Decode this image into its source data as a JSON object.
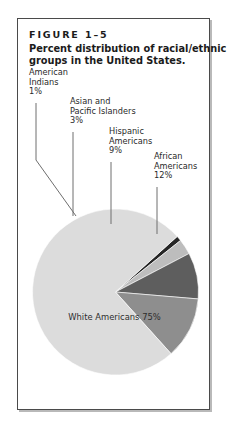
{
  "figure": {
    "number": "FIGURE 1–5",
    "caption_line1": "Percent distribution of racial/ethnic",
    "caption_line2": "groups in the United States."
  },
  "callouts": [
    {
      "key": "american-indians",
      "line1": "American",
      "line2": "Indians",
      "line3": "1%"
    },
    {
      "key": "asian-pacific",
      "line1": "Asian and",
      "line2": "Pacific Islanders",
      "line3": "3%"
    },
    {
      "key": "hispanic",
      "line1": "Hispanic",
      "line2": "Americans",
      "line3": "9%"
    },
    {
      "key": "african",
      "line1": "African",
      "line2": "Americans",
      "line3": "12%"
    }
  ],
  "inner_label": {
    "white_americans": "White Americans 75%"
  },
  "chart_data": {
    "type": "pie",
    "title": "Percent distribution of racial/ethnic groups in the United States.",
    "units": "percent",
    "total": 100,
    "legend": "none (direct labels with leader lines)",
    "grid": false,
    "start_angle_deg": -42,
    "direction": "clockwise",
    "categories": [
      "American Indians",
      "Asian and Pacific Islanders",
      "Hispanic Americans",
      "African Americans",
      "White Americans"
    ],
    "values": [
      1,
      3,
      9,
      12,
      75
    ],
    "labels": [
      "1%",
      "3%",
      "9%",
      "12%",
      "75%"
    ],
    "colors": [
      "#262626",
      "#bdbdbd",
      "#5e5e5e",
      "#8e8e8e",
      "#dcdcdc"
    ],
    "slices": [
      {
        "name": "American Indians",
        "value": 1,
        "label": "1%",
        "color": "#262626"
      },
      {
        "name": "Asian and Pacific Islanders",
        "value": 3,
        "label": "3%",
        "color": "#bdbdbd"
      },
      {
        "name": "Hispanic Americans",
        "value": 9,
        "label": "9%",
        "color": "#5e5e5e"
      },
      {
        "name": "African Americans",
        "value": 12,
        "label": "12%",
        "color": "#8e8e8e"
      },
      {
        "name": "White Americans",
        "value": 75,
        "label": "75%",
        "color": "#dcdcdc"
      }
    ]
  },
  "style": {
    "frame_border": "#4a4a4a",
    "leader_line": "#6e6e6e",
    "text": "#1b1b1b",
    "page_bg": "#ffffff"
  }
}
